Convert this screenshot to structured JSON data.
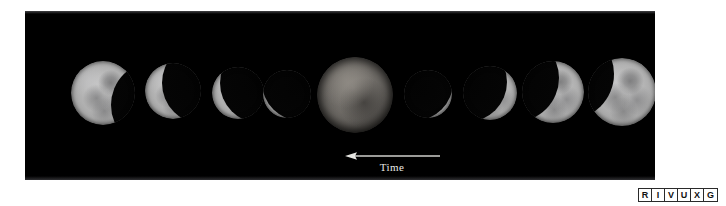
{
  "figure": {
    "kind": "astronomy-photo-figure",
    "caption_text": "",
    "background_color": "#ffffff",
    "panel_color": "#000000",
    "panel": {
      "x": 25,
      "y": 11,
      "width": 630,
      "height": 169
    }
  },
  "annotation": {
    "arrow_label": "Time",
    "arrow_direction": "left",
    "arrow_color": "#d8d8d4",
    "label_color": "#e8e8e4",
    "arrow_x": 320,
    "arrow_y": 141,
    "arrow_length": 95
  },
  "spectrum_indicator": {
    "name": "RIVUXG",
    "bands": [
      {
        "letter": "R",
        "meaning": "Radio",
        "active": false
      },
      {
        "letter": "I",
        "meaning": "Infrared",
        "active": false
      },
      {
        "letter": "V",
        "meaning": "Visible",
        "active": false
      },
      {
        "letter": "U",
        "meaning": "Ultraviolet",
        "active": false
      },
      {
        "letter": "X",
        "meaning": "X-ray",
        "active": false
      },
      {
        "letter": "G",
        "meaning": "Gamma ray",
        "active": false
      }
    ],
    "border_color": "#2a2a2a",
    "text_color": "#111111"
  },
  "moons": [
    {
      "index": 1,
      "phase_label": "partial eclipse, shadow entering from right",
      "cx": 103,
      "cy": 93,
      "r": 32,
      "umbra": {
        "cx_offset": 52,
        "cy_offset": 12,
        "r": 44
      }
    },
    {
      "index": 2,
      "phase_label": "partial eclipse, about half covered",
      "cx": 173,
      "cy": 91,
      "r": 28,
      "umbra": {
        "cx_offset": 30,
        "cy_offset": -8,
        "r": 41
      }
    },
    {
      "index": 3,
      "phase_label": "deep partial eclipse, crescent remaining on left",
      "cx": 238,
      "cy": 93,
      "r": 26,
      "umbra": {
        "cx_offset": 22,
        "cy_offset": -10,
        "r": 40
      }
    },
    {
      "index": 4,
      "phase_label": "just before totality, thin sliver on left",
      "cx": 287,
      "cy": 94,
      "r": 24,
      "umbra": {
        "cx_offset": 14,
        "cy_offset": -12,
        "r": 39
      }
    },
    {
      "index": 5,
      "phase_label": "totality, dim fully eclipsed disc",
      "cx": 355,
      "cy": 95,
      "r": 38,
      "umbra": null
    },
    {
      "index": 6,
      "phase_label": "just after totality, thin sliver on right",
      "cx": 428,
      "cy": 94,
      "r": 24,
      "umbra": {
        "cx_offset": -14,
        "cy_offset": -12,
        "r": 39
      }
    },
    {
      "index": 7,
      "phase_label": "deep partial eclipse, crescent remaining on right",
      "cx": 490,
      "cy": 93,
      "r": 27,
      "umbra": {
        "cx_offset": -23,
        "cy_offset": -11,
        "r": 40
      }
    },
    {
      "index": 8,
      "phase_label": "partial eclipse, shadow leaving from left",
      "cx": 553,
      "cy": 92,
      "r": 31,
      "umbra": {
        "cx_offset": -38,
        "cy_offset": -14,
        "r": 44
      }
    },
    {
      "index": 9,
      "phase_label": "end of eclipse, nearly full disc",
      "cx": 622,
      "cy": 92,
      "r": 34,
      "umbra": {
        "cx_offset": -54,
        "cy_offset": -18,
        "r": 46
      }
    }
  ]
}
